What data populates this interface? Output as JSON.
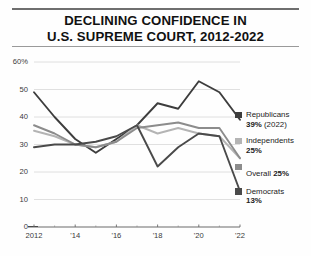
{
  "title": {
    "line1": "DECLINING CONFIDENCE IN",
    "line2": "U.S. SUPREME COURT, 2012-2022"
  },
  "axis": {
    "y_ticks": [
      "60%",
      "50",
      "40",
      "30",
      "20",
      "10",
      "0"
    ],
    "x_ticks": [
      "2012",
      "'14",
      "'16",
      "'18",
      "'20",
      "'22"
    ]
  },
  "legend": [
    {
      "name": "Republicans",
      "value": "39%",
      "suffix": " (2022)",
      "color": "#3d3d3d",
      "inline": false
    },
    {
      "name": "Independents",
      "value": "25%",
      "suffix": "",
      "color": "#b4b4b4",
      "inline": false
    },
    {
      "name": "Overall",
      "value": "25%",
      "suffix": "",
      "color": "#8c8c8c",
      "inline": true
    },
    {
      "name": "Democrats",
      "value": "13%",
      "suffix": "",
      "color": "#4a4a4a",
      "inline": false
    }
  ],
  "chart_data": {
    "type": "line",
    "title": "DECLINING CONFIDENCE IN U.S. SUPREME COURT, 2012-2022",
    "xlabel": "",
    "ylabel": "",
    "ylim": [
      0,
      60
    ],
    "grid": true,
    "legend_position": "right",
    "x": [
      2012,
      2013,
      2014,
      2015,
      2016,
      2017,
      2018,
      2019,
      2020,
      2021,
      2022
    ],
    "series": [
      {
        "name": "Republicans",
        "color": "#3d3d3d",
        "end_label": "39% (2022)",
        "values": [
          49,
          40,
          32,
          27,
          32,
          37,
          45,
          43,
          53,
          49,
          39
        ]
      },
      {
        "name": "Independents",
        "color": "#b4b4b4",
        "end_label": "25%",
        "values": [
          35,
          33,
          30,
          29,
          31,
          37,
          34,
          36,
          34,
          33,
          25
        ]
      },
      {
        "name": "Overall",
        "color": "#8c8c8c",
        "end_label": "25%",
        "values": [
          37,
          34,
          30,
          29,
          31,
          36,
          37,
          38,
          36,
          36,
          25
        ]
      },
      {
        "name": "Democrats",
        "color": "#4a4a4a",
        "end_label": "13%",
        "values": [
          29,
          30,
          30,
          31,
          33,
          37,
          22,
          29,
          34,
          33,
          13
        ]
      }
    ]
  }
}
